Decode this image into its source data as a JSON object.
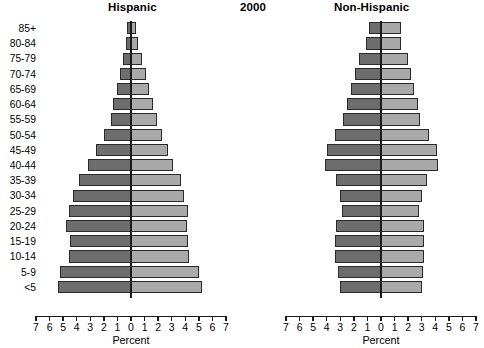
{
  "titles": {
    "left_panel": "Hispanic",
    "year": "2000",
    "right_panel": "Non-Hispanic"
  },
  "axis": {
    "xlabel": "Percent",
    "tick_labels": [
      "7",
      "6",
      "5",
      "4",
      "3",
      "2",
      "1",
      "0",
      "1",
      "2",
      "3",
      "4",
      "5",
      "6",
      "7"
    ],
    "tick_values": [
      -7,
      -6,
      -5,
      -4,
      -3,
      -2,
      -1,
      0,
      1,
      2,
      3,
      4,
      5,
      6,
      7
    ]
  },
  "colors": {
    "left_bar": "#6d6d6d",
    "right_bar": "#a9a9a9",
    "bar_border": "#2a2a2a",
    "axis": "#1a1a1a",
    "background": "#ffffff"
  },
  "age_groups": [
    "85+",
    "80-84",
    "75-79",
    "70-74",
    "65-69",
    "60-64",
    "55-59",
    "50-54",
    "45-49",
    "40-44",
    "35-39",
    "30-34",
    "25-29",
    "20-24",
    "15-19",
    "10-14",
    "5-9",
    "<5"
  ],
  "chart_data": {
    "type": "bar",
    "subtype": "population-pyramid",
    "title": "2000",
    "xlabel": "Percent",
    "ylabel": "",
    "xlim": [
      -7,
      7
    ],
    "grid": false,
    "legend": "none",
    "categories": [
      "85+",
      "80-84",
      "75-79",
      "70-74",
      "65-69",
      "60-64",
      "55-59",
      "50-54",
      "45-49",
      "40-44",
      "35-39",
      "30-34",
      "25-29",
      "20-24",
      "15-19",
      "10-14",
      "5-9",
      "<5"
    ],
    "panels": [
      {
        "name": "Hispanic",
        "series": [
          {
            "name": "left",
            "side": "left",
            "values": [
              0.3,
              0.4,
              0.6,
              0.8,
              1.0,
              1.3,
              1.5,
              2.0,
              2.6,
              3.2,
              3.8,
              4.3,
              4.6,
              4.8,
              4.5,
              4.6,
              5.2,
              5.4
            ]
          },
          {
            "name": "right",
            "side": "right",
            "values": [
              0.4,
              0.5,
              0.8,
              1.1,
              1.3,
              1.6,
              1.9,
              2.3,
              2.7,
              3.1,
              3.7,
              3.9,
              4.2,
              4.1,
              4.2,
              4.3,
              5.0,
              5.2
            ]
          }
        ]
      },
      {
        "name": "Non-Hispanic",
        "series": [
          {
            "name": "left",
            "side": "left",
            "values": [
              0.9,
              1.1,
              1.6,
              1.9,
              2.2,
              2.5,
              2.8,
              3.4,
              4.0,
              4.1,
              3.3,
              3.0,
              2.9,
              3.3,
              3.4,
              3.4,
              3.2,
              3.0
            ]
          },
          {
            "name": "right",
            "side": "right",
            "values": [
              1.5,
              1.5,
              2.0,
              2.2,
              2.4,
              2.7,
              2.9,
              3.5,
              4.1,
              4.2,
              3.4,
              3.0,
              2.8,
              3.2,
              3.2,
              3.2,
              3.1,
              3.0
            ]
          }
        ]
      }
    ]
  }
}
